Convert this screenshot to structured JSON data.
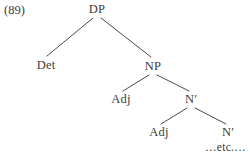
{
  "figure": {
    "example_number": "(89)",
    "etc_label": "…etc.…",
    "line_color": "#4a4a4a",
    "text_color": "#3c3c3c",
    "background_color": "#ffffff"
  },
  "tree": {
    "type": "syntax-tree",
    "nodes": [
      {
        "id": "dp",
        "label": "DP",
        "x": 97,
        "y": 10,
        "level": 0
      },
      {
        "id": "det",
        "label": "Det",
        "x": 46,
        "y": 66,
        "level": 1
      },
      {
        "id": "np",
        "label": "NP",
        "x": 153,
        "y": 67,
        "level": 1
      },
      {
        "id": "adj1",
        "label": "Adj",
        "x": 121,
        "y": 100,
        "level": 2
      },
      {
        "id": "nbar1",
        "label": "N′",
        "x": 191,
        "y": 100,
        "level": 2
      },
      {
        "id": "adj2",
        "label": "Adj",
        "x": 159,
        "y": 133,
        "level": 3
      },
      {
        "id": "nbar2",
        "label": "N′",
        "x": 228,
        "y": 133,
        "level": 3
      }
    ],
    "edges": [
      {
        "from": "dp",
        "to": "det"
      },
      {
        "from": "dp",
        "to": "np"
      },
      {
        "from": "np",
        "to": "adj1"
      },
      {
        "from": "np",
        "to": "nbar1"
      },
      {
        "from": "nbar1",
        "to": "adj2"
      },
      {
        "from": "nbar1",
        "to": "nbar2"
      }
    ]
  }
}
